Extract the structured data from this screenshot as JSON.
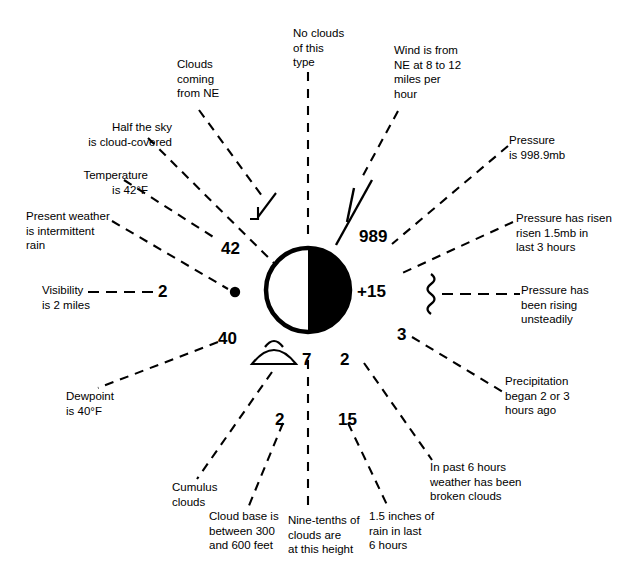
{
  "diagram": {
    "colors": {
      "ink": "#000000",
      "paper": "#ffffff"
    }
  },
  "station": {
    "sky_cover_symbol": "half-filled-circle",
    "present_weather_symbol": "filled-dot",
    "cloud_type_symbol": "cumulus-dome",
    "pressure_tendency_symbol": "vertical-squiggle",
    "wind_barb_symbol": "wind-barb-one-full-barb"
  },
  "values": {
    "temperature": "42",
    "visibility": "2",
    "pressure": "989",
    "pressure_change": "+15",
    "dewpoint": "40",
    "cloud_cover_amount": "7",
    "cloud_base_height": "2",
    "precip_time": "3",
    "past_weather": "2",
    "precip_amount": "15"
  },
  "labels": {
    "clouds_from_ne": "Clouds\ncoming\nfrom NE",
    "no_clouds_type": "No clouds\nof this\ntype",
    "wind": "Wind is from\nNE at 8 to 12\nmiles per\nhour",
    "half_sky": "Half the sky\nis cloud-covered",
    "temperature": "Temperature\nis 42°F",
    "present_weather": "Present weather\nis intermittent\nrain",
    "visibility": "Visibility\nis 2 miles",
    "pressure": "Pressure\nis 998.9mb",
    "pressure_risen": "Pressure has risen\nrisen 1.5mb in\nlast 3 hours",
    "pressure_rising_unsteadily": "Pressure has\nbeen rising\nunsteadily",
    "precipitation_began": "Precipitation\nbegan 2 or 3\nhours ago",
    "past_six_hours": "In past 6 hours\nweather has been\nbroken clouds",
    "rain_amount": "1.5 inches of\nrain in last\n6 hours",
    "nine_tenths": "Nine-tenths of\nclouds are\nat this height",
    "cloud_base": "Cloud base is\nbetween 300\nand 600 feet",
    "cumulus": "Cumulus\nclouds",
    "dewpoint": "Dewpoint\nis 40°F"
  }
}
